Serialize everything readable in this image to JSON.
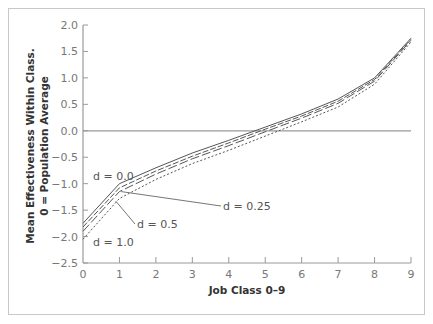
{
  "chart_data": {
    "type": "line",
    "title": "",
    "xlabel": "Job Class 0–9",
    "ylabel": [
      "Mean Effectiveness Within Class.",
      "0 = Population Average"
    ],
    "xlim": [
      0,
      9
    ],
    "ylim": [
      -2.5,
      2.0
    ],
    "x": [
      0,
      1,
      2,
      3,
      4,
      5,
      6,
      7,
      8,
      9
    ],
    "xticks": [
      "0",
      "1",
      "2",
      "3",
      "4",
      "5",
      "6",
      "7",
      "8",
      "9"
    ],
    "yticks": [
      "2.0",
      "1.5",
      "1.0",
      "0.5",
      "0.0",
      "−0.5",
      "−1.0",
      "−1.5",
      "−2.0",
      "−2.5"
    ],
    "grid": false,
    "reference_line": 0.0,
    "series": [
      {
        "name": "d = 0.0",
        "style": "solid",
        "values": [
          -1.75,
          -1.0,
          -0.7,
          -0.42,
          -0.18,
          0.07,
          0.32,
          0.6,
          1.0,
          1.75
        ]
      },
      {
        "name": "d = 0.25",
        "style": "dashed",
        "values": [
          -1.82,
          -1.08,
          -0.76,
          -0.48,
          -0.23,
          0.03,
          0.28,
          0.56,
          0.97,
          1.73
        ]
      },
      {
        "name": "d = 0.5",
        "style": "longdash",
        "values": [
          -1.9,
          -1.15,
          -0.82,
          -0.53,
          -0.28,
          -0.02,
          0.24,
          0.52,
          0.94,
          1.71
        ]
      },
      {
        "name": "d = 1.0",
        "style": "dotted",
        "values": [
          -2.05,
          -1.28,
          -0.92,
          -0.62,
          -0.37,
          -0.1,
          0.17,
          0.45,
          0.88,
          1.68
        ]
      }
    ],
    "annotations": [
      {
        "text": "d = 0.0",
        "x_label": 0.6,
        "y_label": -0.87
      },
      {
        "text": "d = 0.25",
        "x_label": 3.55,
        "y_label": -1.43,
        "points_to_x": 1.05,
        "points_to_y": -1.15
      },
      {
        "text": "d = 0.5",
        "x_label": 1.95,
        "y_label": -1.75,
        "points_to_x": 0.9,
        "points_to_y": -1.33
      },
      {
        "text": "d = 1.0",
        "x_label": 0.25,
        "y_label": -2.02
      }
    ]
  },
  "labels": {
    "xlabel": "Job Class 0–9",
    "ylabel_line1": "Mean Effectiveness Within Class.",
    "ylabel_line2": "0 = Population Average",
    "d00": "d = 0.0",
    "d025": "d = 0.25",
    "d05": "d = 0.5",
    "d10": "d = 1.0"
  }
}
